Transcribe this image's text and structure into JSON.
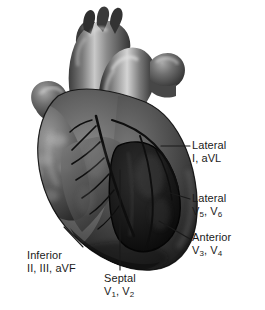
{
  "figure": {
    "background_color": "#ffffff",
    "text_color": "#1a1a1a",
    "width": 265,
    "height": 310
  },
  "illustration": {
    "name": "anatomical-heart",
    "description": "Grayscale anatomical drawing of a human heart, anterior view, with great vessels (aorta, pulmonary trunk, superior vena cava), atrial appendages, coronary arteries and a shaded dark septal/anterior region outlined on the left ventricle.",
    "palette": {
      "darkest": "#121212",
      "dark": "#2b2b2b",
      "mid_dark": "#4a4a4a",
      "mid": "#6e6e6e",
      "mid_light": "#8e8e8e",
      "light": "#b4b4b4",
      "highlight": "#dcdcdc",
      "outline": "#0c0c0c"
    }
  },
  "labels": [
    {
      "id": "lateral-i-avl",
      "region": "Lateral",
      "leads": "I, aVL",
      "leads_plain": "I, aVL",
      "line1": "Lateral",
      "side": "right"
    },
    {
      "id": "lateral-v5-v6",
      "region": "Lateral",
      "leads_plain": "V5, V6",
      "line1": "Lateral",
      "lead_labels": [
        {
          "letter": "V",
          "sub": "5",
          "sep": ", "
        },
        {
          "letter": "V",
          "sub": "6",
          "sep": ""
        }
      ],
      "side": "right"
    },
    {
      "id": "anterior-v3-v4",
      "region": "Anterior",
      "leads_plain": "V3, V4",
      "line1": "Anterior",
      "lead_labels": [
        {
          "letter": "V",
          "sub": "3",
          "sep": ", "
        },
        {
          "letter": "V",
          "sub": "4",
          "sep": ""
        }
      ],
      "side": "right"
    },
    {
      "id": "inferior-ii-iii-avf",
      "region": "Inferior",
      "leads": "II, III, aVF",
      "leads_plain": "II, III, aVF",
      "line1": "Inferior",
      "side": "left"
    },
    {
      "id": "septal-v1-v2",
      "region": "Septal",
      "leads_plain": "V1, V2",
      "line1": "Septal",
      "lead_labels": [
        {
          "letter": "V",
          "sub": "1",
          "sep": ", "
        },
        {
          "letter": "V",
          "sub": "2",
          "sep": ""
        }
      ],
      "side": "center"
    }
  ],
  "leader_lines": [
    {
      "id": "leader-lateral-i-avl",
      "from": [
        160,
        146
      ],
      "to": [
        190,
        146
      ]
    },
    {
      "id": "leader-lateral-v5-v6",
      "from": [
        166,
        192
      ],
      "to": [
        190,
        199
      ]
    },
    {
      "id": "leader-anterior-v3-v4",
      "from": [
        160,
        222
      ],
      "to": [
        190,
        238
      ]
    },
    {
      "id": "leader-inferior",
      "from": [
        83,
        246
      ],
      "to": [
        64,
        228
      ]
    },
    {
      "id": "leader-septal",
      "from": [
        120,
        270
      ],
      "to": [
        120,
        170
      ]
    }
  ]
}
